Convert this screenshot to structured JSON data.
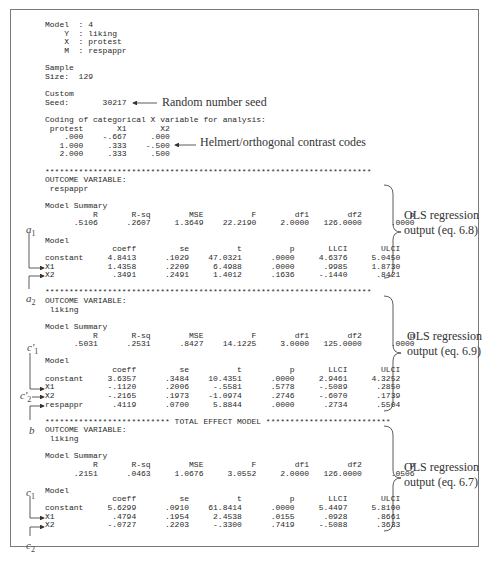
{
  "output_lines": [
    "Model  : 4",
    "    Y  : liking",
    "    X  : protest",
    "    M  : respappr",
    "",
    "Sample",
    "Size:  129",
    "",
    "Custom",
    "Seed:       30217",
    "",
    "Coding of categorical X variable for analysis:",
    " protest       X1       X2",
    "    .000    -.667     .000",
    "   1.000     .333    -.500",
    "   2.000     .333     .500",
    "",
    "********************************************************************",
    "OUTCOME VARIABLE:",
    " respappr",
    "",
    "Model Summary",
    "          R       R-sq        MSE          F        df1        df2          p",
    "      .5106      .2607     1.3649    22.2190     2.0000   126.0000      .0000",
    "",
    "Model",
    "              coeff         se          t          p       LLCI       ULCI",
    "constant     4.8413      .1029    47.0321      .0000     4.6376     5.0450",
    "X1           1.4358      .2209     6.4988      .0000      .9985     1.8730",
    "X2            .3491      .2491     1.4012      .1636     -.1440      .8421",
    "",
    "********************************************************************",
    "OUTCOME VARIABLE:",
    " liking",
    "",
    "Model Summary",
    "          R       R-sq        MSE          F        df1        df2          p",
    "      .5031      .2531      .8427    14.1225     3.0000   125.0000      .0000",
    "",
    "Model",
    "              coeff         se          t          p       LLCI       ULCI",
    "constant     3.6357      .3484    10.4351      .0000     2.9461     4.3252",
    "X1           -.1120      .2006     -.5581      .5778     -.5089      .2850",
    "X2           -.2165      .1973    -1.0974      .2746     -.6070      .1739",
    "respappr      .4119      .0700     5.8844      .0000      .2734      .5504",
    "",
    "************************** TOTAL EFFECT MODEL **************************",
    "OUTCOME VARIABLE:",
    " liking",
    "",
    "Model Summary",
    "          R       R-sq        MSE          F        df1        df2          p",
    "      .2151      .0463     1.0676     3.0552     2.0000   126.0000      .0506",
    "",
    "Model",
    "              coeff         se          t          p       LLCI       ULCI",
    "constant     5.6299      .0910    61.8414      .0000     5.4497     5.8100",
    "X1            .4794      .1954     2.4538      .0155      .0928      .8661",
    "X2           -.0727      .2203     -.3300      .7419     -.5088      .3633"
  ],
  "annotations": {
    "seed_note": "Random number seed",
    "contrast_note": "Helmert/orthogonal contrast codes",
    "ols_blocks": [
      {
        "line1": "OLS regression",
        "line2": "output (eq. 6.8)"
      },
      {
        "line1": "OLS regression",
        "line2": "output (eq. 6.9)"
      },
      {
        "line1": "OLS regression",
        "line2": "output (eq. 6.7)"
      }
    ],
    "path_labels": {
      "a1_base": "a",
      "a1_sub": "1",
      "a2_base": "a",
      "a2_sub": "2",
      "c1p_base": "c",
      "c1p_sub": "1",
      "c2p_base": "c",
      "c2p_sub": "2",
      "b": "b",
      "c1_base": "c",
      "c1_sub": "1",
      "c2_base": "c",
      "c2_sub": "2"
    }
  }
}
